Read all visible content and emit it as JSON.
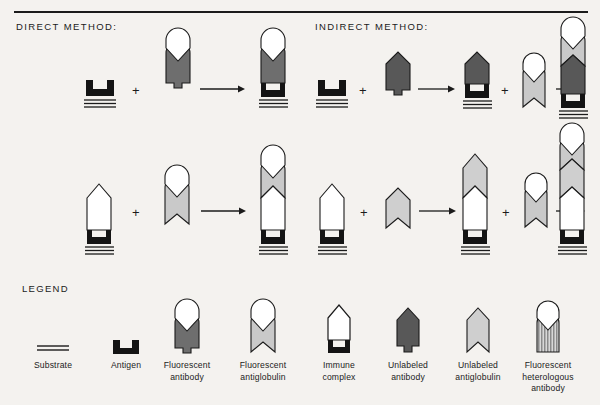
{
  "page": {
    "background_color": "#f4f2ef",
    "rule_color": "#1b1b1b"
  },
  "sections": {
    "direct": {
      "title": "DIRECT METHOD:"
    },
    "indirect": {
      "title": "INDIRECT METHOD:"
    },
    "legend": {
      "title": "LEGEND"
    }
  },
  "operators": {
    "plus": "+",
    "arrow": "→"
  },
  "colors": {
    "outline": "#1b1b1b",
    "antigen_black": "#141414",
    "fluorescent_antibody": "#6e6e6e",
    "fluorescent_antiglobulin": "#c9c9c9",
    "unlabeled_antibody": "#585858",
    "unlabeled_antiglobulin": "#cfcfcf",
    "heterologous_stripes": "#8a8a8a",
    "white": "#ffffff"
  },
  "legend": {
    "items": [
      {
        "key": "substrate",
        "icon": "substrate-lines-icon",
        "label": "Substrate"
      },
      {
        "key": "antigen",
        "icon": "antigen-notch-icon",
        "label": "Antigen"
      },
      {
        "key": "fluorescent_antibody",
        "icon": "fluorescent-antibody-icon",
        "label": "Fluorescent\nantibody"
      },
      {
        "key": "fluorescent_antiglobulin",
        "icon": "fluorescent-antiglobulin-icon",
        "label": "Fluorescent\nantiglobulin"
      },
      {
        "key": "immune_complex",
        "icon": "immune-complex-icon",
        "label": "Immune\ncomplex"
      },
      {
        "key": "unlabeled_antibody",
        "icon": "unlabeled-antibody-icon",
        "label": "Unlabeled\nantibody"
      },
      {
        "key": "unlabeled_antiglobulin",
        "icon": "unlabeled-antiglobulin-icon",
        "label": "Unlabeled\nantiglobulin"
      },
      {
        "key": "fluorescent_heterologous_antibody",
        "icon": "fluorescent-heterologous-antibody-icon",
        "label": "Fluorescent\nheterologous\nantibody"
      }
    ]
  },
  "diagram": {
    "direct": {
      "row1": {
        "reactants": [
          "antigen_on_substrate",
          "fluorescent_antibody"
        ],
        "product": "fluorescent_antibody_bound_to_antigen"
      },
      "row2": {
        "reactants": [
          "immune_complex_on_substrate",
          "fluorescent_antiglobulin"
        ],
        "product": "antiglobulin_bound_to_immune_complex"
      }
    },
    "indirect": {
      "row1": {
        "reactants": [
          "antigen_on_substrate",
          "unlabeled_antibody",
          "fluorescent_antiglobulin"
        ],
        "intermediate": "unlabeled_antibody_bound_to_antigen",
        "product": "fluorescent_antiglobulin_on_antibody_antigen"
      },
      "row2": {
        "reactants": [
          "immune_complex_on_substrate",
          "unlabeled_antiglobulin",
          "fluorescent_antiglobulin"
        ],
        "intermediate": "unlabeled_antiglobulin_on_immune_complex",
        "product": "fluorescent_antiglobulin_on_stack"
      }
    }
  }
}
